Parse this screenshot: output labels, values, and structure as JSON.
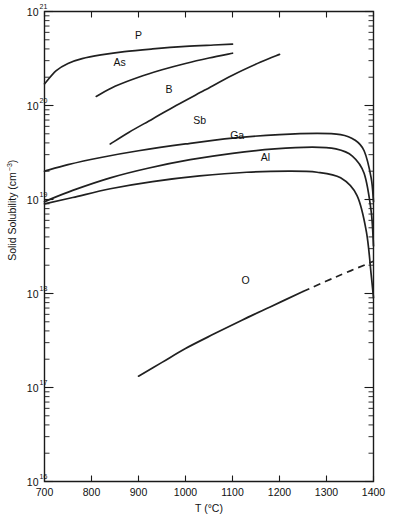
{
  "chart_data": {
    "type": "line",
    "title": "",
    "xlabel": "T (°C)",
    "ylabel": "Solid Solubility (cm⁻³)",
    "xlim": [
      700,
      1400
    ],
    "ylim": [
      1e+16,
      1e+21
    ],
    "yscale": "log",
    "xscale": "linear",
    "grid": false,
    "legend": "inline-curve-labels",
    "xticks": [
      700,
      800,
      900,
      1000,
      1100,
      1200,
      1300,
      1400
    ],
    "xtick_labels": [
      "700",
      "800",
      "900",
      "1000",
      "1100",
      "1200",
      "1300",
      "1400"
    ],
    "yticks": [
      1e+16,
      1e+17,
      1e+18,
      1e+19,
      1e+20,
      1e+21
    ],
    "ytick_labels": [
      "10",
      "10",
      "10",
      "10",
      "10",
      "10"
    ],
    "ytick_exponents": [
      "16",
      "17",
      "18",
      "19",
      "20",
      "21"
    ],
    "series": [
      {
        "name": "P",
        "label": "P",
        "style": "solid",
        "label_x": 900,
        "label_y": 5.1e+20,
        "points": [
          [
            700,
            1.7e+20
          ],
          [
            725,
            2.35e+20
          ],
          [
            750,
            2.8e+20
          ],
          [
            780,
            3.15e+20
          ],
          [
            820,
            3.45e+20
          ],
          [
            870,
            3.75e+20
          ],
          [
            930,
            4e+20
          ],
          [
            1000,
            4.25e+20
          ],
          [
            1060,
            4.4e+20
          ],
          [
            1100,
            4.5e+20
          ]
        ]
      },
      {
        "name": "As",
        "label": "As",
        "style": "solid",
        "label_x": 860,
        "label_y": 2.6e+20,
        "points": [
          [
            810,
            1.25e+20
          ],
          [
            850,
            1.6e+20
          ],
          [
            900,
            2e+20
          ],
          [
            950,
            2.4e+20
          ],
          [
            1000,
            2.8e+20
          ],
          [
            1050,
            3.2e+20
          ],
          [
            1100,
            3.6e+20
          ]
        ]
      },
      {
        "name": "B",
        "label": "B",
        "style": "solid",
        "label_x": 965,
        "label_y": 1.35e+20,
        "points": [
          [
            840,
            3.9e+19
          ],
          [
            880,
            5.2e+19
          ],
          [
            930,
            7.2e+19
          ],
          [
            980,
            1e+20
          ],
          [
            1040,
            1.45e+20
          ],
          [
            1100,
            2.1e+20
          ],
          [
            1160,
            2.9e+20
          ],
          [
            1200,
            3.5e+20
          ]
        ]
      },
      {
        "name": "Sb",
        "label": "Sb",
        "style": "solid",
        "label_x": 1030,
        "label_y": 6.3e+19,
        "points": [
          [
            700,
            2e+19
          ],
          [
            750,
            2.35e+19
          ],
          [
            820,
            2.8e+19
          ],
          [
            900,
            3.3e+19
          ],
          [
            1000,
            3.9e+19
          ],
          [
            1100,
            4.5e+19
          ],
          [
            1200,
            4.9e+19
          ],
          [
            1280,
            5.05e+19
          ],
          [
            1330,
            4.9e+19
          ],
          [
            1360,
            4.3e+19
          ],
          [
            1380,
            3.3e+19
          ],
          [
            1395,
            1.7e+19
          ],
          [
            1400,
            9.5e+18
          ]
        ]
      },
      {
        "name": "Ga",
        "label": "Ga",
        "style": "solid",
        "label_x": 1110,
        "label_y": 4.4e+19,
        "points": [
          [
            700,
            9.5e+18
          ],
          [
            760,
            1.25e+19
          ],
          [
            840,
            1.7e+19
          ],
          [
            920,
            2.15e+19
          ],
          [
            1010,
            2.65e+19
          ],
          [
            1100,
            3.1e+19
          ],
          [
            1190,
            3.45e+19
          ],
          [
            1270,
            3.6e+19
          ],
          [
            1320,
            3.45e+19
          ],
          [
            1355,
            2.9e+19
          ],
          [
            1380,
            1.9e+19
          ],
          [
            1395,
            7.5e+18
          ],
          [
            1400,
            3.2e+18
          ]
        ]
      },
      {
        "name": "Al",
        "label": "Al",
        "style": "solid",
        "label_x": 1170,
        "label_y": 2.55e+19,
        "points": [
          [
            700,
            9e+18
          ],
          [
            760,
            1.05e+19
          ],
          [
            840,
            1.3e+19
          ],
          [
            930,
            1.55e+19
          ],
          [
            1030,
            1.78e+19
          ],
          [
            1130,
            1.95e+19
          ],
          [
            1220,
            2e+19
          ],
          [
            1280,
            1.95e+19
          ],
          [
            1330,
            1.7e+19
          ],
          [
            1365,
            1.1e+19
          ],
          [
            1385,
            4.5e+18
          ],
          [
            1395,
            1.6e+18
          ],
          [
            1400,
            9e+17
          ]
        ]
      },
      {
        "name": "O",
        "label": "O",
        "style": "solid-then-dashed",
        "label_x": 1128,
        "label_y": 1.25e+18,
        "dash_start": 1250,
        "points": [
          [
            900,
            1.32e+17
          ],
          [
            950,
            1.85e+17
          ],
          [
            1000,
            2.6e+17
          ],
          [
            1060,
            3.7e+17
          ],
          [
            1120,
            5.2e+17
          ],
          [
            1180,
            7.2e+17
          ],
          [
            1250,
            1.05e+18
          ],
          [
            1320,
            1.5e+18
          ],
          [
            1400,
            2.2e+18
          ]
        ]
      }
    ]
  }
}
